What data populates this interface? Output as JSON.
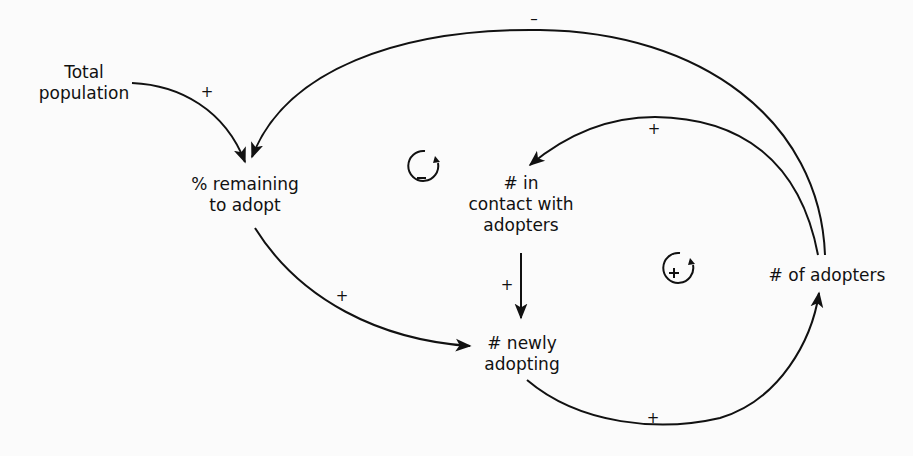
{
  "diagram": {
    "type": "causal-loop",
    "nodes": {
      "total_population": [
        "Total",
        "population"
      ],
      "pct_remaining": [
        "% remaining",
        "to adopt"
      ],
      "in_contact": [
        "# in",
        "contact with",
        "adopters"
      ],
      "newly_adopting": [
        "# newly",
        "adopting"
      ],
      "adopters": [
        "# of adopters"
      ]
    },
    "links": [
      {
        "from": "Total population",
        "to": "% remaining to adopt",
        "polarity": "+"
      },
      {
        "from": "# of adopters",
        "to": "% remaining to adopt",
        "polarity": "–"
      },
      {
        "from": "# of adopters",
        "to": "# in contact with adopters",
        "polarity": "+"
      },
      {
        "from": "% remaining to adopt",
        "to": "# newly adopting",
        "polarity": "+"
      },
      {
        "from": "# in contact with adopters",
        "to": "# newly adopting",
        "polarity": "+"
      },
      {
        "from": "# newly adopting",
        "to": "# of adopters",
        "polarity": "+"
      }
    ],
    "loops": [
      {
        "name": "balancing",
        "symbol": "–"
      },
      {
        "name": "reinforcing",
        "symbol": "+"
      }
    ],
    "colors": {
      "ink": "#111111",
      "background": "#fbfbfb"
    }
  }
}
